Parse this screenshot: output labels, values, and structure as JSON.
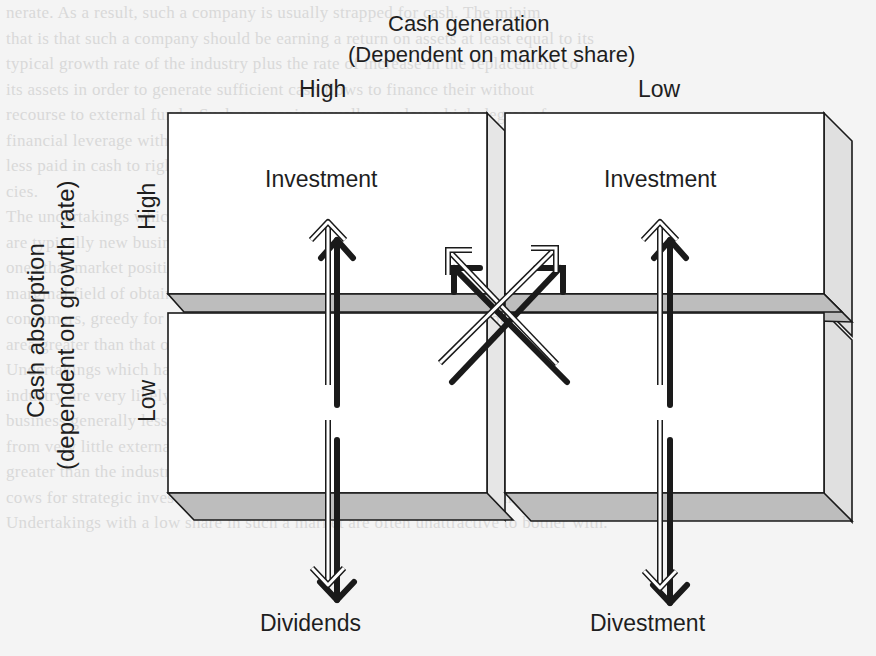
{
  "figure": {
    "top_axis": {
      "title_line1": "Cash generation",
      "title_line2": "(Dependent on market share)",
      "high_label": "High",
      "low_label": "Low"
    },
    "left_axis": {
      "title_line1": "Cash absorption",
      "title_line2": "(dependent on growth rate)",
      "high_label": "High",
      "low_label": "Low"
    },
    "cells": {
      "top_left": "Investment",
      "top_right": "Investment",
      "bottom_left": "Dividends",
      "bottom_right": "Divestment"
    },
    "arrows": [
      {
        "name": "high-share-vertical",
        "direction": "up-and-down",
        "from": "Dividends",
        "to": "Investment"
      },
      {
        "name": "low-share-vertical",
        "direction": "up-and-down",
        "from": "Divestment",
        "to": "Investment"
      },
      {
        "name": "cross-diagonal-1",
        "direction": "diagonal",
        "note": "crossing arrows between quadrants"
      },
      {
        "name": "cross-diagonal-2",
        "direction": "diagonal",
        "note": "crossing arrows between quadrants"
      }
    ],
    "colors": {
      "box_fill": "#ffffff",
      "box_stroke": "#1a1a1a",
      "shelf_fill": "#bdbdbd",
      "side_fill": "#e0e0e0",
      "arrow_dark": "#1a1a1a",
      "arrow_light": "#d0d0d0",
      "background": "#f4f4f4",
      "background_text": "#d9d9d9"
    }
  },
  "background_text": [
    "nerate. As a result, such a company is usually strapped for cash. The minim",
    "that is that such a company should be earning a return on assets at least equal to its",
    "typical growth rate of the industry plus the rate of increase in the replacement co",
    "its assets in order to generate sufficient cash flows to finance their without",
    "recourse to external funds. Such companies usually employ a high degree of",
    "financial leverage with the attendant exposure to a high degree of financial risk.",
    "less paid in cash to rights issues and seldom pay more than nominal dividends.",
    "cies.",
    "The undertakings which have a low market share in a high growth industry",
    "are typically new businesses which have been launched in a new industry or",
    "ones that market positions have not yet become entrenched and the business",
    "marginal field of obtaining a worthwhile share. These firms are short-term cash",
    "consumers, greedy for cash and their future cash requirements position in one",
    "area greater than that of the high market share undertakings.",
    "Undertakings which have a high market share in a mature, slow growth",
    "industry are very likely to show a high ROI. Their investment in their existing",
    "business generally less capital spending, and they are cash rich, with surplus",
    "from very little external finance. They usually generate rates of return which are",
    "greater than the industry growth rate plus inflation, sometimes acting like cash",
    "cows for strategic investment to enlarge their market share at the expense of their rivals.",
    "Undertakings with a low share in such a market are often unattractive to bother with."
  ]
}
